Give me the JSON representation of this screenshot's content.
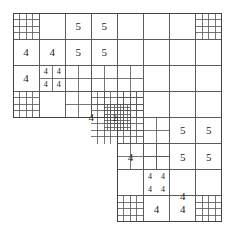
{
  "figure": {
    "origin": [
      13,
      13
    ],
    "cell": 26.1,
    "grid_size": 8,
    "line_color": "#555555"
  },
  "domain_cells": {
    "note": "coarse cells [col,row] in 8x8 grid; L-shape: rows 0-3 all cols, rows 4-7 cols 4-7",
    "rows_full": [
      0,
      1,
      2,
      3
    ],
    "rows_partial": [
      4,
      5,
      6,
      7
    ],
    "partial_cols": [
      4,
      5,
      6,
      7
    ]
  },
  "refinements": [
    {
      "x": 0,
      "y": 0,
      "w": 1,
      "h": 1,
      "n": 4
    },
    {
      "x": 7,
      "y": 0,
      "w": 1,
      "h": 1,
      "n": 4
    },
    {
      "x": 0,
      "y": 3,
      "w": 1,
      "h": 1,
      "n": 4
    },
    {
      "x": 4,
      "y": 7,
      "w": 1,
      "h": 1,
      "n": 4
    },
    {
      "x": 7,
      "y": 7,
      "w": 1,
      "h": 1,
      "n": 4
    },
    {
      "x": 1,
      "y": 2,
      "w": 1,
      "h": 1,
      "n": 2
    },
    {
      "x": 5,
      "y": 5,
      "w": 1,
      "h": 1,
      "n": 2
    },
    {
      "x": 2,
      "y": 2,
      "w": 2,
      "h": 2,
      "n": 4
    },
    {
      "x": 4,
      "y": 2,
      "w": 1,
      "h": 1,
      "n": 2
    },
    {
      "x": 4,
      "y": 4,
      "w": 2,
      "h": 2,
      "n": 4
    },
    {
      "x": 3,
      "y": 3,
      "w": 2,
      "h": 2,
      "n": 8
    },
    {
      "x": 3.5,
      "y": 3.5,
      "w": 1,
      "h": 1,
      "n": 8
    },
    {
      "x": 4,
      "y": 3,
      "w": 1,
      "h": 1,
      "n": 4
    }
  ],
  "labels": [
    {
      "col": 2,
      "row": 0,
      "text": "5"
    },
    {
      "col": 3,
      "row": 0,
      "text": "5"
    },
    {
      "col": 0,
      "row": 1,
      "text": "4"
    },
    {
      "col": 1,
      "row": 1,
      "text": "4"
    },
    {
      "col": 2,
      "row": 1,
      "text": "5"
    },
    {
      "col": 3,
      "row": 1,
      "text": "5"
    },
    {
      "col": 0,
      "row": 2,
      "text": "4"
    },
    {
      "col": 1.25,
      "row": 2.25,
      "text": "4",
      "small": true
    },
    {
      "col": 1.75,
      "row": 2.25,
      "text": "4",
      "small": true
    },
    {
      "col": 1.25,
      "row": 2.75,
      "text": "4",
      "small": true
    },
    {
      "col": 1.75,
      "row": 2.75,
      "text": "4",
      "small": true
    },
    {
      "col": 2.5,
      "row": 3.5,
      "text": "4"
    },
    {
      "col": 3.9,
      "row": 4.05,
      "text": "2",
      "small": true
    },
    {
      "col": 6,
      "row": 4,
      "text": "5"
    },
    {
      "col": 7,
      "row": 4,
      "text": "5"
    },
    {
      "col": 4,
      "row": 5,
      "text": "4"
    },
    {
      "col": 6,
      "row": 5,
      "text": "5"
    },
    {
      "col": 7,
      "row": 5,
      "text": "5"
    },
    {
      "col": 5.25,
      "row": 6.25,
      "text": "4",
      "small": true
    },
    {
      "col": 5.75,
      "row": 6.25,
      "text": "4",
      "small": true
    },
    {
      "col": 5.25,
      "row": 6.75,
      "text": "4",
      "small": true
    },
    {
      "col": 5.75,
      "row": 6.75,
      "text": "4",
      "small": true
    },
    {
      "col": 6,
      "row": 6.5,
      "text": "4"
    },
    {
      "col": 5,
      "row": 7,
      "text": "4"
    },
    {
      "col": 6,
      "row": 7,
      "text": "4"
    }
  ]
}
